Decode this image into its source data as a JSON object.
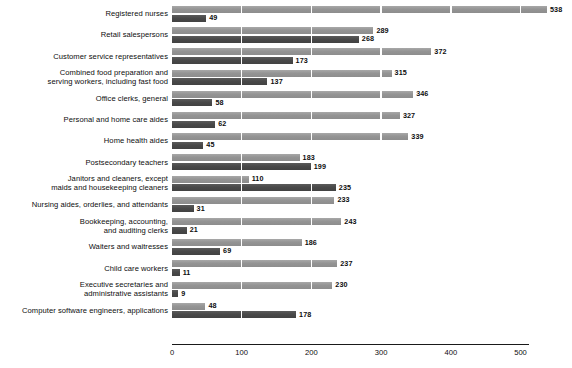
{
  "chart_data": {
    "type": "bar",
    "orientation": "horizontal",
    "title": "",
    "subtitle": "",
    "xlabel": "",
    "ylabel": "",
    "xlim": [
      0,
      538
    ],
    "xticks": [
      0,
      100,
      200,
      300,
      400,
      500
    ],
    "xtick_labels": [
      "0",
      "100",
      "200",
      "300",
      "400",
      "500"
    ],
    "grid": true,
    "grid_axis": "x",
    "legend": "none",
    "colors": {
      "series_light": "#9a9a9a",
      "series_dark": "#4e4e4e",
      "text": "#0d0d0d",
      "background": "#ffffff",
      "axis": "#1a1a1a"
    },
    "categories": [
      "Registered nurses",
      "Retail salespersons",
      "Customer service representatives",
      "Combined food preparation and\nserving workers, including fast food",
      "Office clerks, general",
      "Personal and home care aides",
      "Home health aides",
      "Postsecondary teachers",
      "Janitors and cleaners, except\nmaids and housekeeping cleaners",
      "Nursing aides, orderlies, and attendants",
      "Bookkeeping, accounting,\nand auditing clerks",
      "Waiters and waitresses",
      "Child care workers",
      "Executive secretaries and\nadministrative assistants",
      "Computer software engineers, applications"
    ],
    "series": [
      {
        "name": "light",
        "values": [
          538,
          289,
          372,
          315,
          346,
          327,
          339,
          183,
          110,
          233,
          243,
          186,
          237,
          230,
          48
        ]
      },
      {
        "name": "dark",
        "values": [
          49,
          268,
          173,
          137,
          58,
          62,
          45,
          199,
          235,
          31,
          21,
          69,
          11,
          9,
          178
        ]
      }
    ]
  }
}
